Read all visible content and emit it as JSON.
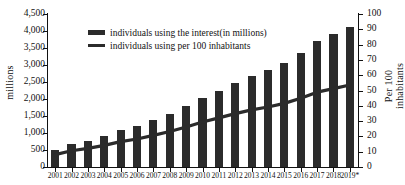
{
  "chart_data": {
    "type": "bar",
    "title": "",
    "xlabel": "",
    "ylabel": "millions",
    "ylabel_secondary": "Per 100 inhabitants",
    "grid": false,
    "legend_position": "top-left-inside",
    "ylim": [
      0,
      4500
    ],
    "ylim_secondary": [
      0,
      100
    ],
    "ytick_labels": [
      "4,500",
      "4,000",
      "3,500",
      "3,000",
      "2,500",
      "2,000",
      "1,500",
      "1,000",
      "500",
      "0"
    ],
    "ytick_values": [
      4500,
      4000,
      3500,
      3000,
      2500,
      2000,
      1500,
      1000,
      500,
      0
    ],
    "ytick_labels_secondary": [
      "100",
      "90",
      "80",
      "70",
      "60",
      "50",
      "40",
      "30",
      "20",
      "10",
      "0"
    ],
    "ytick_values_secondary": [
      100,
      90,
      80,
      70,
      60,
      50,
      40,
      30,
      20,
      10,
      0
    ],
    "categories": [
      "2001",
      "2002",
      "2003",
      "2004",
      "2005",
      "2006",
      "2007",
      "2008",
      "2009",
      "2010",
      "2011",
      "2012",
      "2013",
      "2014",
      "2015",
      "2016",
      "2017",
      "2018",
      "2019*"
    ],
    "series": [
      {
        "name": "individuals using the interest(in millions)",
        "type": "bar",
        "axis": "left",
        "unit": "millions",
        "color": "#2b2b2b",
        "values": [
          495,
          665,
          775,
          905,
          1080,
          1205,
          1380,
          1560,
          1780,
          2030,
          2240,
          2470,
          2670,
          2840,
          3060,
          3350,
          3700,
          3920,
          4130
        ]
      },
      {
        "name": "individuals using per 100 inhabitants",
        "type": "line",
        "axis": "right",
        "unit": "per 100 inhabitants",
        "color": "#2b2b2b",
        "values": [
          8.1,
          10.6,
          12.2,
          14.1,
          16.6,
          18.3,
          20.7,
          23.2,
          26.1,
          29.4,
          32.1,
          34.9,
          37.3,
          39.2,
          41.6,
          44.9,
          48.9,
          51.2,
          53.6
        ]
      }
    ]
  },
  "legend": {
    "items": [
      {
        "label": "individuals using the interest(in millions)",
        "marker": "bar-swatch"
      },
      {
        "label": "individuals using per 100 inhabitants",
        "marker": "line-swatch"
      }
    ]
  }
}
